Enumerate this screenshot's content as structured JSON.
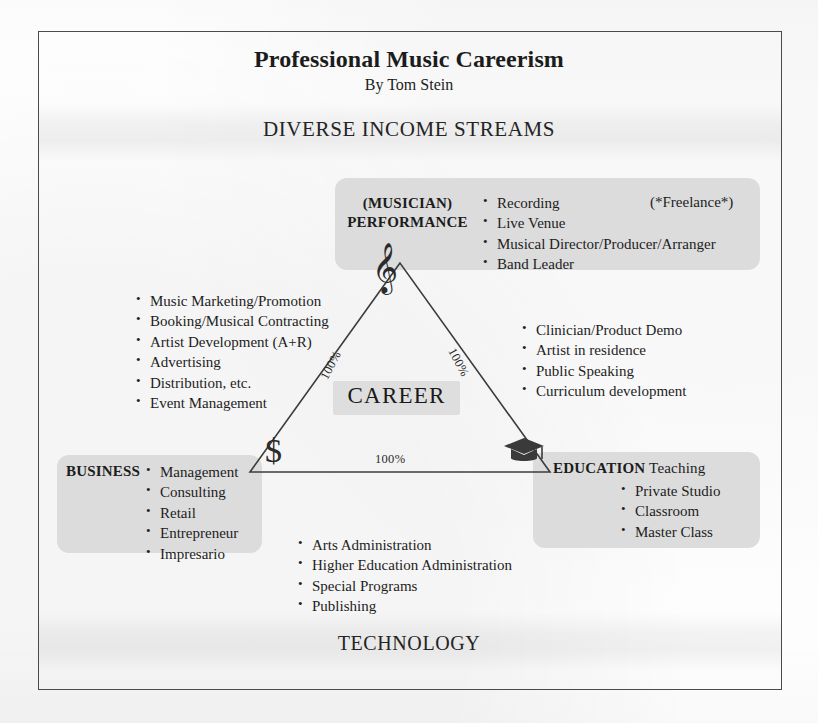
{
  "document": {
    "title": "Professional Music Careerism",
    "byline": "By Tom Stein",
    "top_header": "DIVERSE INCOME STREAMS",
    "bottom_footer": "TECHNOLOGY"
  },
  "diagram": {
    "center_label": "CAREER",
    "edge_labels": {
      "left": "100%",
      "right": "100%",
      "bottom": "100%"
    },
    "vertex_icons": {
      "top": "treble-clef-icon",
      "bottom_left": "dollar-sign-icon",
      "bottom_right": "graduation-cap-icon"
    }
  },
  "performance": {
    "subtitle": "(MUSICIAN)",
    "name": "PERFORMANCE",
    "tag": "(*Freelance*)",
    "items": [
      "Recording",
      "Live Venue",
      "Musical Director/Producer/Arranger",
      "Band Leader"
    ]
  },
  "business": {
    "name": "BUSINESS",
    "items": [
      "Management",
      "Consulting",
      "Retail",
      "Entrepreneur",
      "Impresario"
    ]
  },
  "education": {
    "name": "EDUCATION",
    "name_secondary": "Teaching",
    "items": [
      "Private Studio",
      "Classroom",
      "Master Class"
    ]
  },
  "music_business_list": {
    "items": [
      "Music Marketing/Promotion",
      "Booking/Musical Contracting",
      "Artist Development (A+R)",
      "Advertising",
      "Distribution, etc.",
      "Event Management"
    ]
  },
  "education_outreach_list": {
    "items": [
      "Clinician/Product Demo",
      "Artist in residence",
      "Public Speaking",
      "Curriculum development"
    ]
  },
  "administration_list": {
    "items": [
      "Arts Administration",
      "Higher Education Administration",
      "Special Programs",
      "Publishing"
    ]
  },
  "colors": {
    "box_fill": "#dcdcdc",
    "chip_fill": "#dedede",
    "frame_stroke": "#4a4a4a",
    "triangle_stroke": "#3c3c3c",
    "text": "#1c1c1c"
  }
}
